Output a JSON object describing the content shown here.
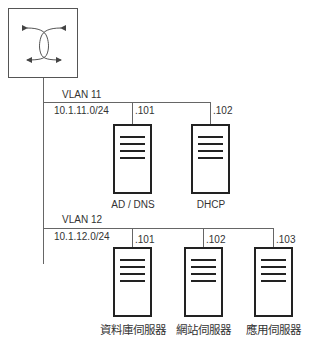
{
  "switch": {
    "icon": "switch-icon"
  },
  "vlans": [
    {
      "name": "VLAN 11",
      "subnet": "10.1.11.0/24",
      "servers": [
        {
          "host": ".101",
          "label": "AD / DNS"
        },
        {
          "host": ".102",
          "label": "DHCP"
        }
      ]
    },
    {
      "name": "VLAN 12",
      "subnet": "10.1.12.0/24",
      "servers": [
        {
          "host": ".101",
          "label": "資料庫伺服器"
        },
        {
          "host": ".102",
          "label": "網站伺服器"
        },
        {
          "host": ".103",
          "label": "應用伺服器"
        }
      ]
    }
  ]
}
